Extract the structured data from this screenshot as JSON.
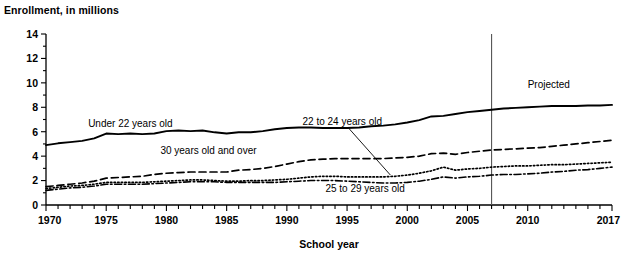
{
  "figure": {
    "cropped_heading": "",
    "y_axis_title": "Enrollment, in millions",
    "x_axis_title": "School year",
    "projected_label": "Projected"
  },
  "chart_data": {
    "type": "line",
    "title": "Enrollment, in millions",
    "xlabel": "School year",
    "ylabel": "Enrollment, in millions",
    "xlim": [
      1970,
      2017
    ],
    "ylim": [
      0,
      14
    ],
    "ytick_values": [
      0,
      2,
      4,
      6,
      8,
      10,
      12,
      14
    ],
    "ytick_labels": [
      "0",
      "2",
      "4",
      "6",
      "8",
      "10",
      "12",
      "14"
    ],
    "xtick_values": [
      1970,
      1975,
      1980,
      1985,
      1990,
      1995,
      2000,
      2005,
      2010,
      2017
    ],
    "xtick_labels": [
      "1970",
      "1975",
      "1980",
      "1985",
      "1990",
      "1995",
      "2000",
      "2005",
      "2010",
      "2017"
    ],
    "minor_xticks_interval": 1,
    "minor_yticks_interval": 1,
    "grid": false,
    "legend": "inline-annotations",
    "projection_start_year": 2007,
    "annotations": [
      {
        "text": "Under 22 years old",
        "x": 1973.5,
        "y": 6.35,
        "anchor": "start"
      },
      {
        "text": "30 years old and over",
        "x": 1979.5,
        "y": 4.15,
        "anchor": "start"
      },
      {
        "text": "22 to 24 years old",
        "x": 1991.3,
        "y": 6.55,
        "anchor": "start",
        "leader_to": {
          "x": 1998.6,
          "y": 2.45
        }
      },
      {
        "text": "25 to 29 years old",
        "x": 1993.2,
        "y": 1.05,
        "anchor": "start"
      },
      {
        "text": "Projected",
        "x": 2010.0,
        "y": 9.6,
        "anchor": "start"
      }
    ],
    "x": [
      1970,
      1971,
      1972,
      1973,
      1974,
      1975,
      1976,
      1977,
      1978,
      1979,
      1980,
      1981,
      1982,
      1983,
      1984,
      1985,
      1986,
      1987,
      1988,
      1989,
      1990,
      1991,
      1992,
      1993,
      1994,
      1995,
      1996,
      1997,
      1998,
      1999,
      2000,
      2001,
      2002,
      2003,
      2004,
      2005,
      2006,
      2007,
      2008,
      2009,
      2010,
      2011,
      2012,
      2013,
      2014,
      2015,
      2016,
      2017
    ],
    "series": [
      {
        "name": "Under 22 years old",
        "style": "solid",
        "values": [
          4.9,
          5.05,
          5.15,
          5.25,
          5.45,
          5.85,
          5.8,
          5.85,
          5.8,
          5.85,
          6.05,
          6.1,
          6.05,
          6.1,
          5.95,
          5.85,
          5.95,
          5.95,
          6.05,
          6.2,
          6.3,
          6.35,
          6.35,
          6.3,
          6.3,
          6.3,
          6.35,
          6.45,
          6.5,
          6.6,
          6.75,
          6.95,
          7.25,
          7.3,
          7.45,
          7.6,
          7.7,
          7.8,
          7.9,
          7.95,
          8.0,
          8.05,
          8.1,
          8.1,
          8.1,
          8.15,
          8.15,
          8.2
        ]
      },
      {
        "name": "30 years old and over",
        "style": "dashed",
        "values": [
          1.5,
          1.6,
          1.7,
          1.8,
          1.95,
          2.2,
          2.25,
          2.3,
          2.35,
          2.5,
          2.6,
          2.65,
          2.7,
          2.7,
          2.7,
          2.7,
          2.85,
          2.9,
          3.0,
          3.15,
          3.35,
          3.55,
          3.7,
          3.75,
          3.8,
          3.8,
          3.8,
          3.8,
          3.8,
          3.85,
          3.9,
          4.0,
          4.2,
          4.25,
          4.15,
          4.3,
          4.4,
          4.5,
          4.55,
          4.6,
          4.65,
          4.7,
          4.8,
          4.9,
          5.0,
          5.1,
          5.2,
          5.3
        ]
      },
      {
        "name": "22 to 24 years old",
        "style": "dotted",
        "values": [
          1.35,
          1.45,
          1.55,
          1.6,
          1.7,
          1.85,
          1.85,
          1.85,
          1.85,
          1.9,
          1.95,
          2.0,
          2.05,
          2.05,
          2.0,
          1.95,
          1.95,
          2.0,
          2.0,
          2.05,
          2.1,
          2.2,
          2.3,
          2.35,
          2.35,
          2.3,
          2.3,
          2.3,
          2.3,
          2.35,
          2.45,
          2.6,
          2.8,
          3.1,
          2.85,
          2.95,
          3.0,
          3.1,
          3.15,
          3.2,
          3.2,
          3.25,
          3.3,
          3.3,
          3.35,
          3.4,
          3.45,
          3.5
        ]
      },
      {
        "name": "25 to 29 years old",
        "style": "dashdot",
        "values": [
          1.2,
          1.3,
          1.4,
          1.45,
          1.55,
          1.7,
          1.7,
          1.7,
          1.7,
          1.75,
          1.8,
          1.85,
          1.9,
          1.9,
          1.9,
          1.85,
          1.85,
          1.85,
          1.85,
          1.85,
          1.9,
          1.95,
          2.0,
          2.0,
          2.0,
          1.95,
          1.9,
          1.85,
          1.8,
          1.8,
          1.85,
          1.95,
          2.1,
          2.3,
          2.2,
          2.3,
          2.35,
          2.45,
          2.5,
          2.5,
          2.55,
          2.6,
          2.7,
          2.75,
          2.85,
          2.9,
          3.0,
          3.1
        ]
      }
    ]
  }
}
